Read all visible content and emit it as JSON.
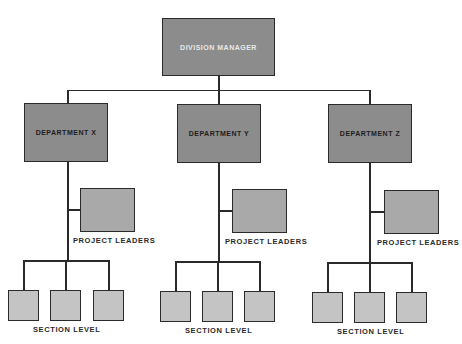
{
  "top": {
    "label": "DIVISION MANAGER"
  },
  "departments": [
    {
      "label": "DEPARTMENT X",
      "project_label": "PROJECT LEADERS",
      "section_label": "SECTION LEVEL"
    },
    {
      "label": "DEPARTMENT Y",
      "project_label": "PROJECT LEADERS",
      "section_label": "SECTION LEVEL"
    },
    {
      "label": "DEPARTMENT Z",
      "project_label": "PROJECT LEADERS",
      "section_label": "SECTION LEVEL"
    }
  ],
  "colors": {
    "manager_fill": "#8c8c8c",
    "department_fill": "#8c8c8c",
    "project_fill": "#a9a9a9",
    "section_fill": "#c4c4c4",
    "line": "#2a2a2a"
  }
}
